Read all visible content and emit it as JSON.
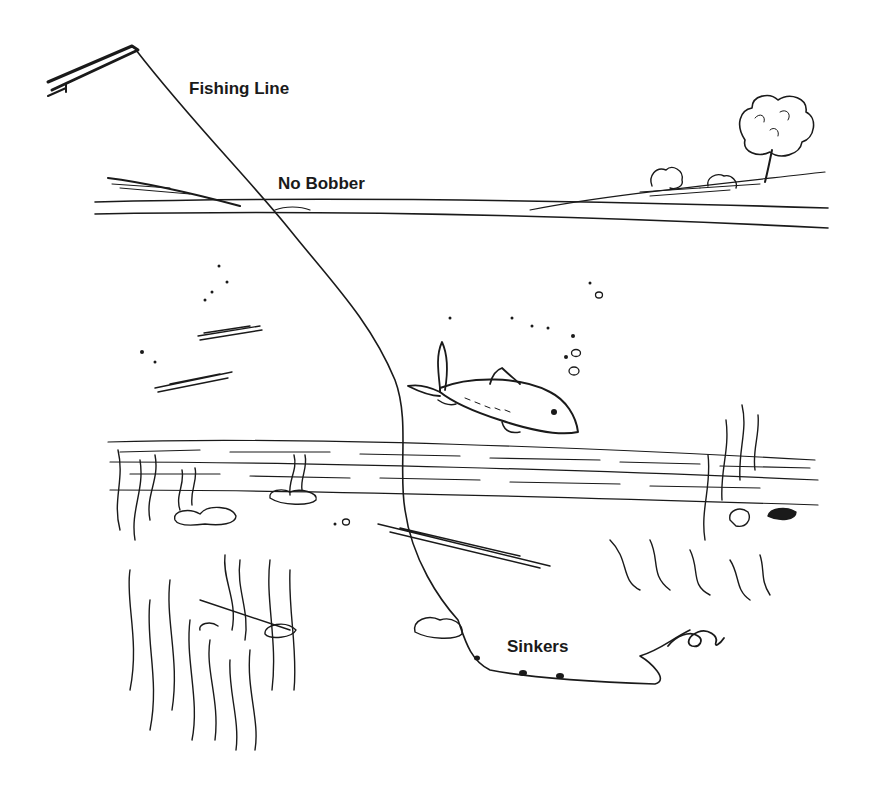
{
  "diagram": {
    "labels": {
      "fishing_line": "Fishing Line",
      "no_bobber": "No Bobber",
      "sinkers": "Sinkers"
    },
    "elements": [
      "fishing-rod",
      "fishing-line",
      "water-surface",
      "shoreline",
      "tree",
      "bushes",
      "fish",
      "bubbles",
      "weeds",
      "rocks",
      "lake-bottom",
      "sinkers",
      "bait"
    ],
    "ink_color": "#1a1a1a",
    "background_color": "#ffffff",
    "sinker_count": 2
  }
}
